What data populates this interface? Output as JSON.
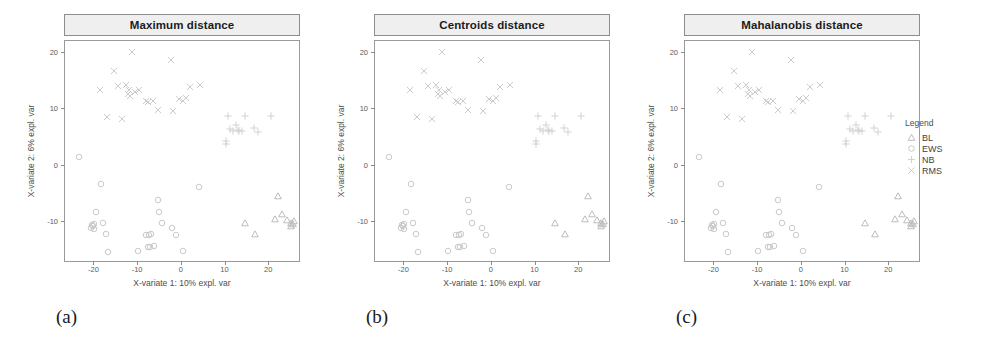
{
  "figure": {
    "subcaptions": [
      "(a)",
      "(b)",
      "(c)"
    ]
  },
  "axes": {
    "xlabel": "X-variate 1: 10% expl. var",
    "ylabel": "X-variate 2: 6% expl. var",
    "xticks": [
      -20,
      -10,
      0,
      10,
      20
    ],
    "yticks": [
      -10,
      0,
      10,
      20
    ],
    "xlim": [
      -26.5,
      27.5
    ],
    "ylim": [
      -17.5,
      22.0
    ]
  },
  "legend": {
    "title": "Legend",
    "items": [
      {
        "label": "BL",
        "marker": "triangle-up-marker",
        "color": "#b9b9b9"
      },
      {
        "label": "EWS",
        "marker": "circle-marker",
        "color": "#c6c6c6"
      },
      {
        "label": "NB",
        "marker": "plus-marker",
        "color": "#cfcfcf"
      },
      {
        "label": "RMS",
        "marker": "cross-marker",
        "color": "#c9c9c9"
      }
    ]
  },
  "chart_data": {
    "type": "scatter",
    "xlabel": "X-variate 1: 10% expl. var",
    "ylabel": "X-variate 2: 6% expl. var",
    "xlim": [
      -26.5,
      27.5
    ],
    "ylim": [
      -17.5,
      22.0
    ],
    "grid": false,
    "legend_position": "right",
    "panels": [
      {
        "title": "Maximum distance",
        "caption": "(a)"
      },
      {
        "title": "Centroids distance",
        "caption": "(b)"
      },
      {
        "title": "Mahalanobis distance",
        "caption": "(c)"
      }
    ],
    "panels_share_data": true,
    "series": [
      {
        "name": "RMS",
        "marker": "cross-marker",
        "color": "#c9c9c9",
        "points": [
          [
            -11.2,
            20.1
          ],
          [
            -2.3,
            18.6
          ],
          [
            -15.3,
            16.6
          ],
          [
            -18.6,
            13.3
          ],
          [
            -14.4,
            14.0
          ],
          [
            -12.6,
            14.2
          ],
          [
            -11.9,
            13.3
          ],
          [
            -12.1,
            12.6
          ],
          [
            -11.6,
            12.2
          ],
          [
            -10.4,
            12.9
          ],
          [
            -9.6,
            13.2
          ],
          [
            -8.0,
            11.3
          ],
          [
            -7.4,
            11.2
          ],
          [
            -6.3,
            11.4
          ],
          [
            -5.2,
            9.7
          ],
          [
            -1.8,
            9.6
          ],
          [
            0.6,
            11.4
          ],
          [
            1.3,
            11.9
          ],
          [
            2.0,
            13.8
          ],
          [
            4.3,
            14.2
          ],
          [
            -16.8,
            8.4
          ],
          [
            -13.4,
            8.2
          ],
          [
            -0.4,
            11.6
          ]
        ]
      },
      {
        "name": "NB",
        "marker": "plus-marker",
        "color": "#cfcfcf",
        "points": [
          [
            10.7,
            8.6
          ],
          [
            12.6,
            7.0
          ],
          [
            13.0,
            6.2
          ],
          [
            14.0,
            6.0
          ],
          [
            14.6,
            8.6
          ],
          [
            16.8,
            6.5
          ],
          [
            17.6,
            5.8
          ],
          [
            20.6,
            8.6
          ],
          [
            11.2,
            6.3
          ],
          [
            11.9,
            6.0
          ],
          [
            10.4,
            3.6
          ],
          [
            10.4,
            4.2
          ],
          [
            13.4,
            6.0
          ]
        ]
      },
      {
        "name": "EWS",
        "marker": "circle-marker",
        "color": "#c6c6c6",
        "points": [
          [
            -23.4,
            1.3
          ],
          [
            -18.2,
            -3.5
          ],
          [
            -19.4,
            -8.5
          ],
          [
            -19.9,
            -10.6
          ],
          [
            -20.1,
            -11.0
          ],
          [
            -20.3,
            -10.8
          ],
          [
            -19.8,
            -11.4
          ],
          [
            -17.9,
            -10.3
          ],
          [
            -17.2,
            -12.4
          ],
          [
            -16.6,
            -15.5
          ],
          [
            -8.0,
            -12.5
          ],
          [
            -7.2,
            -12.5
          ],
          [
            -6.9,
            -12.3
          ],
          [
            -7.4,
            -14.6
          ],
          [
            -7.0,
            -14.7
          ],
          [
            -6.1,
            -14.5
          ],
          [
            -5.3,
            -6.3
          ],
          [
            -5.0,
            -8.5
          ],
          [
            -4.4,
            -10.4
          ],
          [
            -2.0,
            -11.3
          ],
          [
            -1.2,
            -12.6
          ],
          [
            0.4,
            -15.4
          ],
          [
            4.2,
            -3.9
          ],
          [
            -9.7,
            -15.4
          ],
          [
            -20.6,
            -11.3
          ]
        ]
      },
      {
        "name": "BL",
        "marker": "triangle-up-marker",
        "color": "#b9b9b9",
        "points": [
          [
            14.8,
            -10.4
          ],
          [
            17.0,
            -12.4
          ],
          [
            22.3,
            -5.5
          ],
          [
            21.5,
            -9.6
          ],
          [
            23.2,
            -8.7
          ],
          [
            24.2,
            -9.9
          ],
          [
            25.3,
            -10.3
          ],
          [
            25.6,
            -10.6
          ],
          [
            25.1,
            -11.0
          ],
          [
            25.8,
            -10.0
          ]
        ]
      }
    ]
  }
}
